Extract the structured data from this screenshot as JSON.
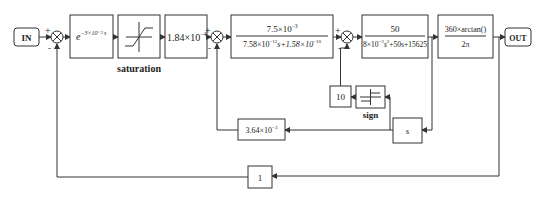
{
  "diagram": {
    "type": "block-diagram",
    "input": {
      "label": "IN"
    },
    "output": {
      "label": "OUT"
    },
    "blocks": [
      {
        "id": "delay",
        "expr": "e",
        "exp": "−3×10⁻³ s"
      },
      {
        "id": "saturation",
        "label": "saturation"
      },
      {
        "id": "gain1",
        "expr": "1.84×10",
        "exp": "−4"
      },
      {
        "id": "tf1",
        "num_base": "7.5×10",
        "num_exp": "−3",
        "den_a": "7.58×10",
        "den_a_exp": "−12",
        "den_b": "s+1.58×10",
        "den_b_exp": "−10"
      },
      {
        "id": "tf2",
        "num": "50",
        "den_a": "8×10",
        "den_a_exp": "−3",
        "den_b": "s",
        "den_b_exp": "2",
        "den_c": "+50s+15625"
      },
      {
        "id": "arctan",
        "num": "360×arctan()",
        "den": "2π"
      },
      {
        "id": "gain10",
        "label": "10"
      },
      {
        "id": "sign",
        "label": "sign"
      },
      {
        "id": "deriv",
        "label": "s"
      },
      {
        "id": "gain3",
        "expr": "3.64×10",
        "exp": "−3"
      },
      {
        "id": "unity",
        "label": "1"
      }
    ],
    "sums": [
      {
        "id": "sum1",
        "plus": "+",
        "minus": "-"
      },
      {
        "id": "sum2",
        "plus": "+",
        "minus": "-"
      },
      {
        "id": "sum3",
        "plus": "+",
        "minus": "-"
      }
    ]
  }
}
